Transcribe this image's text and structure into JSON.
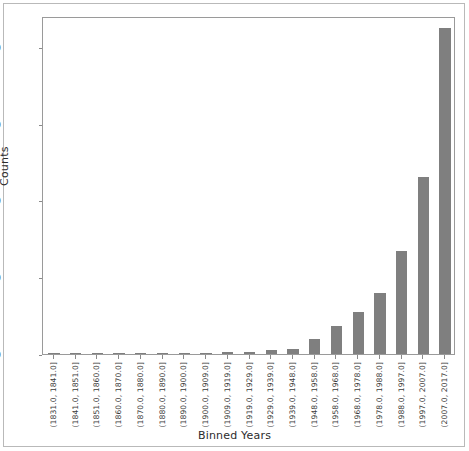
{
  "chart_data": {
    "type": "bar",
    "title": "",
    "xlabel": "Binned Years",
    "ylabel": "Counts",
    "grid": false,
    "legend": null,
    "bar_color": "#7f7f7f",
    "ylim": [
      0,
      4400
    ],
    "yticks": [
      0,
      1000,
      2000,
      3000,
      4000
    ],
    "ytick_labels": [
      "0",
      "1000",
      "2000",
      "3000",
      "4000"
    ],
    "categories": [
      "(1831.0, 1841.0]",
      "(1841.0, 1851.0]",
      "(1851.0, 1860.0]",
      "(1860.0, 1870.0]",
      "(1870.0, 1880.0]",
      "(1880.0, 1890.0]",
      "(1890.0, 1900.0]",
      "(1900.0, 1909.0]",
      "(1909.0, 1919.0]",
      "(1919.0, 1929.0]",
      "(1929.0, 1939.0]",
      "(1939.0, 1948.0]",
      "(1948.0, 1958.0]",
      "(1958.0, 1968.0]",
      "(1968.0, 1978.0]",
      "(1978.0, 1988.0]",
      "(1988.0, 1997.0]",
      "(1997.0, 2007.0]",
      "(2007.0, 2017.0]"
    ],
    "values": [
      3,
      3,
      4,
      4,
      4,
      5,
      10,
      14,
      22,
      30,
      56,
      62,
      195,
      370,
      545,
      800,
      1340,
      2300,
      4250
    ]
  }
}
